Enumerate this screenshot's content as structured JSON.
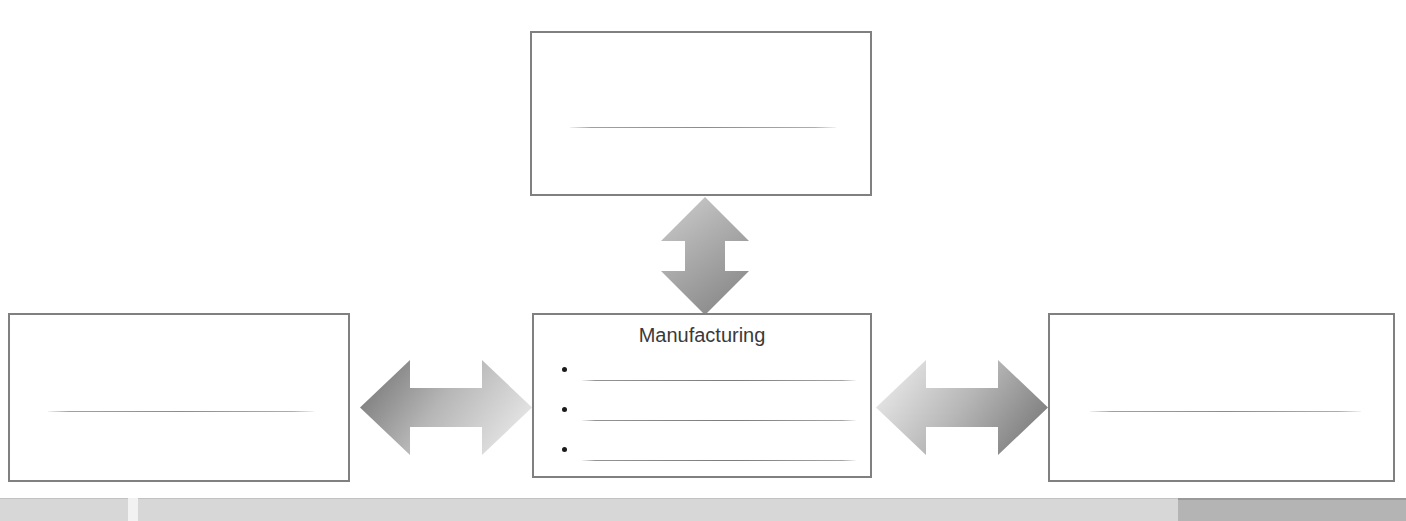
{
  "slide": {
    "width": 1406,
    "height": 521,
    "background": "#ffffff",
    "type": "relationship-diagram-worksheet"
  },
  "diagram": {
    "center_node": {
      "id": "center-box",
      "label": "Manufacturing",
      "has_title": true,
      "bullets": [
        {
          "index": 1,
          "text": "",
          "blank": true
        },
        {
          "index": 2,
          "text": "",
          "blank": true
        },
        {
          "index": 3,
          "text": "",
          "blank": true
        }
      ]
    },
    "top_node": {
      "id": "top-box",
      "label": "",
      "blank": true,
      "has_title": false
    },
    "left_node": {
      "id": "left-box",
      "label": "",
      "blank": true,
      "has_title": false
    },
    "right_node": {
      "id": "right-box",
      "label": "",
      "blank": true,
      "has_title": false
    },
    "connectors": [
      {
        "id": "arrow-vertical",
        "shape": "double-headed-arrow",
        "orientation": "vertical",
        "from": "top-box",
        "to": "center-box",
        "gradient_from": "#c9c9c9",
        "gradient_to": "#8f8f8f"
      },
      {
        "id": "arrow-left",
        "shape": "double-headed-arrow",
        "orientation": "horizontal",
        "from": "left-box",
        "to": "center-box",
        "gradient_from": "#7d7d7d",
        "gradient_to": "#e4e4e4"
      },
      {
        "id": "arrow-right",
        "shape": "double-headed-arrow",
        "orientation": "horizontal",
        "from": "center-box",
        "to": "right-box",
        "gradient_from": "#e4e4e4",
        "gradient_to": "#7d7d7d"
      }
    ]
  },
  "colors": {
    "box_border": "#808080",
    "box_fill": "#ffffff",
    "title_text": "#3a3a3a",
    "bullet_dot": "#1a1a1a",
    "blank_line": "#787878",
    "bottom_bar": "#d7d7d7",
    "bottom_bar_dark": "#b4b4b4"
  },
  "bottom_bar": {
    "label": "",
    "segment_label": ""
  }
}
